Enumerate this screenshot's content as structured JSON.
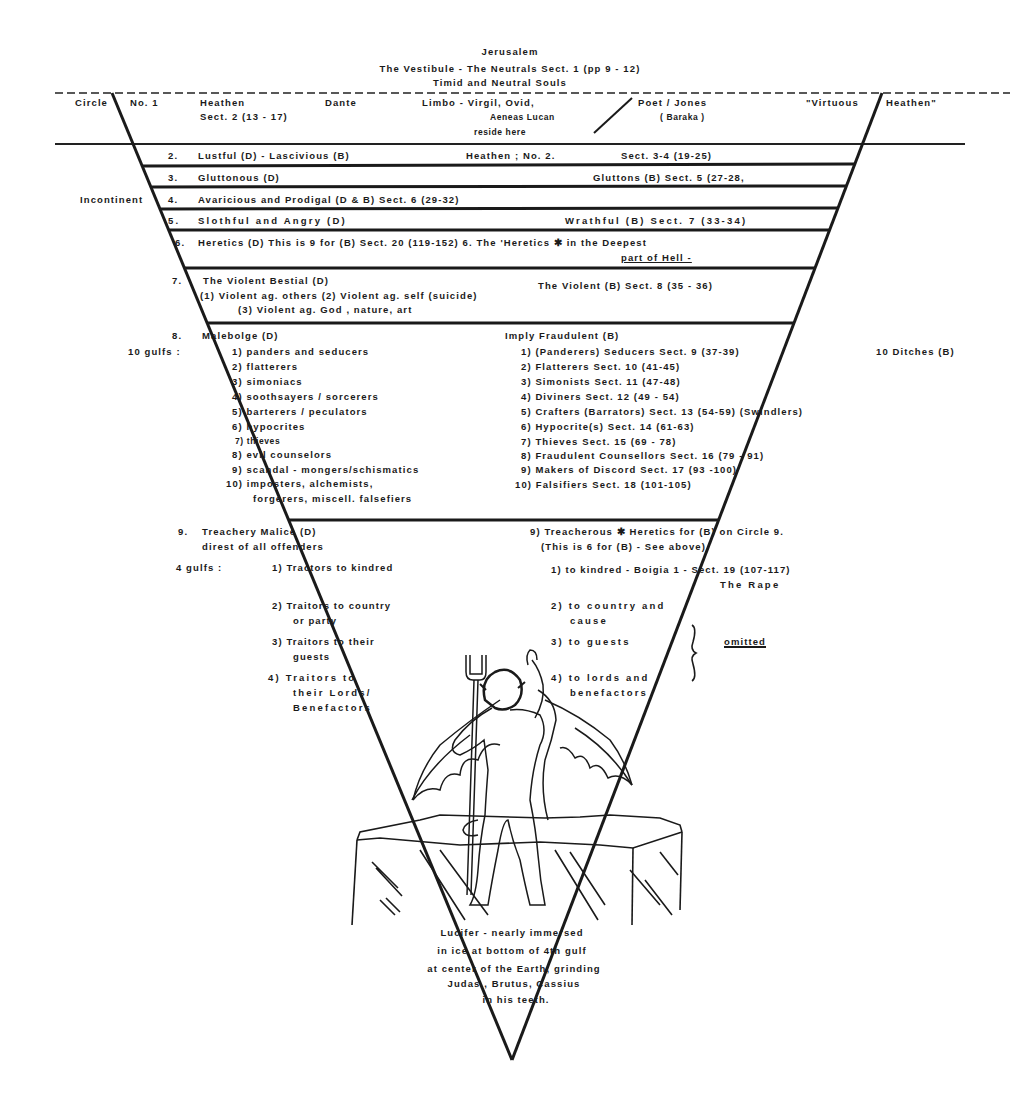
{
  "header": {
    "top_label": "Jerusalem",
    "vestibule": "The   Vestibule   -   The   Neutrals   Sect.   1   (pp  9  -  12)",
    "vestibule_sub": "Timid   and   Neutral  Souls"
  },
  "circle1": {
    "circle_label": "Circle",
    "number": "No. 1",
    "heathen": "Heathen",
    "sect": "Sect. 2 (13  -  17)",
    "dante": "Dante",
    "limbo": "Limbo   -   Virgil,   Ovid,",
    "aeneas": "Aeneas   Lucan",
    "reside": "reside   here",
    "poet": "Poet  /  Jones",
    "baraka": "( Baraka )",
    "virtuous": "\"Virtuous",
    "heathen_quote": "Heathen\""
  },
  "circles_2_6": [
    {
      "num": "2.",
      "left": "Lustful (D)    -    Lascivious (B)",
      "mid": "Heathen ; No.  2.",
      "right": "Sect. 3-4 (19-25)"
    },
    {
      "num": "3.",
      "left": "Gluttonous (D)",
      "right": "Gluttons (B) Sect. 5  (27-28,"
    },
    {
      "num": "4.",
      "left": "Avaricious and Prodigal  (D & B)  Sect. 6 (29-32)"
    },
    {
      "num": "5.",
      "left": "Slothful  and Angry (D)",
      "right": "Wrathful  (B) Sect. 7 (33-34)"
    },
    {
      "num": "6.",
      "left": "Heretics (D)  This is  9  for (B) Sect. 20 (119-152)  6. The 'Heretics ✱ in the   Deepest",
      "sub": "part of Hell  -"
    }
  ],
  "incontinent_label": "Incontinent",
  "circle7": {
    "num": "7.",
    "title": "The  Violent  Bestial (D)",
    "line1": "(1) Violent  ag.  others          (2)  Violent  ag.  self    (suicide)",
    "line2": "(3) Violent  ag.  God ,    nature,    art",
    "right": "The  Violent (B) Sect. 8   (35  -  36)"
  },
  "circle8": {
    "num": "8.",
    "title": "Malebolge (D)",
    "gulfs_label": "10  gulfs :",
    "right_title": "Imply  Fraudulent (B)",
    "right_note": "10  Ditches (B)",
    "dante_items": [
      "1) panders  and  seducers",
      "2) flatterers",
      "3) simoniacs",
      "4) soothsayers  /  sorcerers",
      "5) barterers  /  peculators",
      "6) hypocrites",
      "7) thieves",
      "8) evil  counselors",
      "9) scandal - mongers/schismatics",
      "10) imposters,  alchemists,",
      "forgerers,  miscell. falsefiers"
    ],
    "baraka_items": [
      "1) (Panderers) Seducers Sect. 9 (37-39)",
      "2) Flatterers Sect. 10 (41-45)",
      "3) Simonists Sect. 11 (47-48)",
      "4) Diviners  Sect. 12  (49  -  54)",
      "5) Crafters (Barrators) Sect. 13 (54-59)   (Swindlers)",
      "6) Hypocrite(s)  Sect. 14 (61-63)",
      "7) Thieves   Sect. 15 (69 - 78)",
      "8) Fraudulent Counsellors  Sect. 16  (79 - 91)",
      "9) Makers  of  Discord    Sect. 17  (93 -100)",
      "10) Falsifiers Sect. 18 (101-105)"
    ]
  },
  "circle9": {
    "num": "9.",
    "title": "Treachery  Malice (D)",
    "subtitle": "direst  of  all  offenders",
    "gulfs_label": "4 gulfs :",
    "right_title": "9) Treacherous ✱ Heretics  for  (B)  on  Circle  9.",
    "right_sub": "(This  is  6  for  (B)  -  See  above)",
    "dante_items": [
      {
        "l1": "1)  Tractors  to  kindred"
      },
      {
        "l1": "2)  Traitors  to  country",
        "l2": "or  party"
      },
      {
        "l1": "3)  Traitors  to  their",
        "l2": "guests"
      },
      {
        "l1": "4)  Traitors  to",
        "l2": "their  Lords/",
        "l3": "Benefactors"
      }
    ],
    "baraka_items": [
      {
        "l1": "1) to kindred -  Boigia 1 -       Sect. 19 (107-117)",
        "l2": "The Rape"
      },
      {
        "l1": "2) to country and",
        "l2": "cause"
      },
      {
        "l1": "3) to guests"
      },
      {
        "l1": "4) to lords and",
        "l2": "benefactors"
      }
    ],
    "omitted": "omitted"
  },
  "lucifer": {
    "caption": [
      "Lucifer  -  nearly  immersed",
      "in  ice  at  bottom  of  4th  gulf",
      "at  center  of  the  Earth,  grinding",
      "Judas ,  Brutus,  Cassius",
      "in  his  teeth."
    ]
  },
  "colors": {
    "ink": "#1a1a1a",
    "paper": "#ffffff"
  }
}
